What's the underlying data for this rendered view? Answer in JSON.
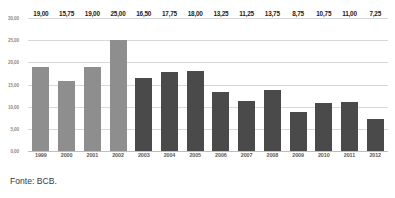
{
  "chart_data": {
    "type": "bar",
    "title": "",
    "subtitle": "",
    "xlabel": "",
    "ylabel": "",
    "ylim": [
      0,
      30
    ],
    "ytick_values": [
      30,
      25,
      20,
      15,
      10,
      5,
      0
    ],
    "ytick_labels": [
      "30,00",
      "25,00",
      "20,00",
      "15,00",
      "10,00",
      "5,00",
      "0,00"
    ],
    "grid": true,
    "legend": "none",
    "categories": [
      "1999",
      "2000",
      "2001",
      "2002",
      "2003",
      "2004",
      "2005",
      "2006",
      "2007",
      "2008",
      "2009",
      "2010",
      "2011",
      "2012"
    ],
    "values": [
      19.0,
      15.75,
      19.0,
      25.0,
      16.5,
      17.75,
      18.0,
      13.25,
      11.25,
      13.75,
      8.75,
      10.75,
      11.0,
      7.25
    ],
    "value_labels": [
      "19,00",
      "15,75",
      "19,00",
      "25,00",
      "16,50",
      "17,75",
      "18,00",
      "13,25",
      "11,25",
      "13,75",
      "8,75",
      "10,75",
      "11,00",
      "7,25"
    ],
    "bar_shades": [
      "light",
      "light",
      "light",
      "light",
      "dark",
      "dark",
      "dark",
      "dark",
      "dark",
      "dark",
      "dark",
      "dark",
      "dark",
      "dark"
    ],
    "colors": {
      "bar_light": "#8e8e8e",
      "bar_dark": "#4a4a4a",
      "gridline": "#d8d8d8",
      "baseline": "#bdbdbd",
      "label_text": "#222222",
      "axis_text": "#5a5a5a",
      "ytick_text": "#8a8a8a",
      "background": "#ffffff"
    }
  },
  "footer": {
    "source_note": "Fonte: BCB."
  }
}
